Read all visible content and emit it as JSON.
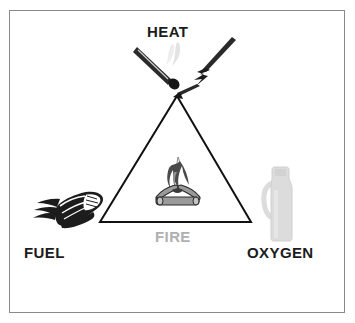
{
  "diagram": {
    "frame": {
      "border_color": "#8a8a8a",
      "background_color": "#ffffff"
    },
    "center_label": {
      "text": "FIRE",
      "color": "#b0b0b0",
      "name": "fire-center-label"
    },
    "vertices": [
      {
        "id": "heat",
        "label": "HEAT",
        "color": "#1c1c1c",
        "position": "top",
        "icon": "match-and-lightning-icon"
      },
      {
        "id": "fuel",
        "label": "FUEL",
        "color": "#1c1c1c",
        "position": "bottom-left",
        "icon": "wood-kindling-icon"
      },
      {
        "id": "oxygen",
        "label": "OXYGEN",
        "color": "#1c1c1c",
        "position": "bottom-right",
        "icon": "oxygen-bottle-icon"
      }
    ],
    "center_icon": "campfire-icon",
    "triangle": {
      "stroke_color": "#111111",
      "stroke_width": 2,
      "apex": [
        177,
        96
      ],
      "bottom_left": [
        100,
        222
      ],
      "bottom_right": [
        251,
        222
      ]
    },
    "palette": {
      "ink": "#1c1c1c",
      "gray_light": "#b0b0b0",
      "gray_mid": "#8a8a8a",
      "bottle": "#dcdcdc",
      "log": "#9a9a9a",
      "flame": "#4a4a4a"
    }
  }
}
